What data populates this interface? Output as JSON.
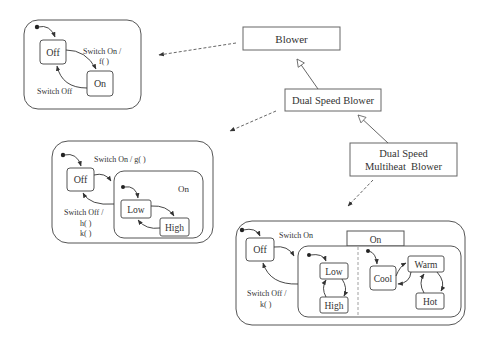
{
  "classes": {
    "blower": "Blower",
    "dual_speed_blower": "Dual Speed Blower",
    "dual_speed_multiheat_blower_line1": "Dual Speed",
    "dual_speed_multiheat_blower_line2": "Multiheat  Blower"
  },
  "machine1": {
    "states": {
      "off": "Off",
      "on": "On"
    },
    "transitions": {
      "switch_on_line1": "Switch On /",
      "switch_on_line2": "f( )",
      "switch_off": "Switch Off"
    }
  },
  "machine2": {
    "states": {
      "off": "Off",
      "on": "On",
      "low": "Low",
      "high": "High"
    },
    "transitions": {
      "switch_on": "Switch On / g( )",
      "switch_off_line1": "Switch Off /",
      "switch_off_line2": "h( )",
      "switch_off_line3": "k( )"
    }
  },
  "machine3": {
    "states": {
      "off": "Off",
      "on": "On",
      "low": "Low",
      "high": "High",
      "cool": "Cool",
      "warm": "Warm",
      "hot": "Hot"
    },
    "transitions": {
      "switch_on": "Switch On",
      "switch_off_line1": "Switch Off /",
      "switch_off_line2": "k( )"
    }
  },
  "colors": {
    "line": "#555555",
    "text": "#333333",
    "background": "#ffffff"
  }
}
